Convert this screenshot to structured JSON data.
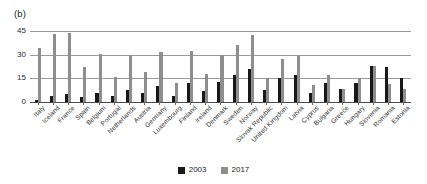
{
  "panel": {
    "label": "(b)"
  },
  "legend": {
    "position": "bottom-center",
    "items": [
      {
        "name": "2003",
        "color": "#191919"
      },
      {
        "name": "2017",
        "color": "#8e8e8e"
      }
    ]
  },
  "axis": {
    "yticks": [
      "45",
      "30",
      "15",
      "0"
    ],
    "ymin": 0,
    "ymax": 45
  },
  "chart_data": {
    "type": "bar",
    "title": "",
    "subtitle": "",
    "xlabel": "",
    "ylabel": "",
    "ylim": [
      0,
      45
    ],
    "yticks": [
      0,
      15,
      30,
      45
    ],
    "grid": true,
    "legend_position": "bottom-center",
    "annotations": [
      "(b)"
    ],
    "categories": [
      "Italy",
      "Iceland",
      "France",
      "Spain",
      "Belgium",
      "Portugal",
      "Netherlands",
      "Austria",
      "Germany",
      "Luxembourg",
      "Finland",
      "Ireland",
      "Denmark",
      "Sweden",
      "Norway",
      "Slovak Republic",
      "United Kingdom",
      "Latvia",
      "Cyprus",
      "Bulgaria",
      "Greece",
      "Hungary",
      "Slovenia",
      "Romania",
      "Estonia"
    ],
    "series": [
      {
        "name": "2003",
        "color": "#191919",
        "values": [
          1.5,
          3.5,
          5.0,
          3.0,
          5.5,
          3.5,
          7.5,
          5.5,
          10.0,
          3.5,
          12.0,
          7.0,
          13.0,
          17.0,
          21.0,
          7.5,
          15.0,
          17.0,
          6.0,
          12.0,
          8.0,
          12.0,
          23.0,
          22.0,
          15.0
        ]
      },
      {
        "name": "2017",
        "color": "#8e8e8e",
        "values": [
          34.0,
          43.0,
          43.5,
          22.5,
          30.5,
          16.0,
          29.5,
          19.0,
          31.5,
          12.0,
          32.5,
          17.5,
          30.0,
          36.0,
          42.5,
          15.0,
          27.5,
          29.0,
          10.5,
          17.0,
          8.0,
          15.0,
          23.0,
          11.5,
          8.0
        ]
      }
    ]
  }
}
